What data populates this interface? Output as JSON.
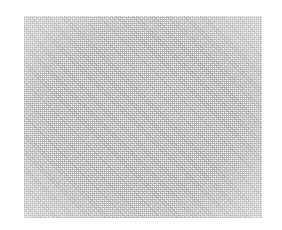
{
  "image": {
    "description": "Grayscale dithered noise texture rectangle on white background",
    "colors": {
      "background": "#ffffff",
      "texture_base": "#e9e9e9",
      "texture_dots": "#8c8c8c"
    }
  }
}
